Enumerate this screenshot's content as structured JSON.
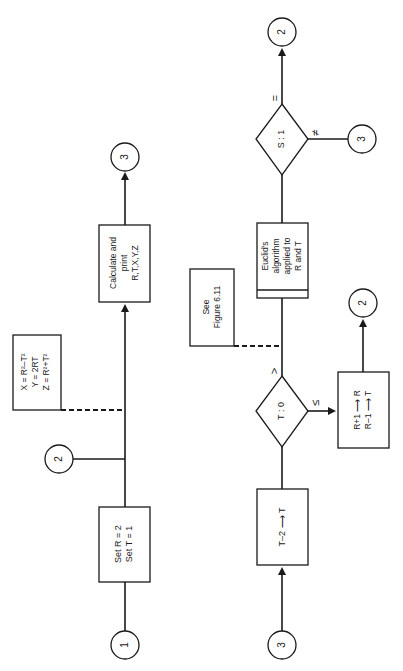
{
  "diagram": {
    "orientation": "rotated 90deg counter-clockwise",
    "colors": {
      "ink": "#1a1a1a",
      "background": "#ffffff"
    },
    "flow_top": {
      "start_connector": "1",
      "init_box": {
        "line1": "Set   R  =  2",
        "line2": "Set   T  =  1"
      },
      "entry_connector": "2",
      "formula_box": {
        "line1": "X  =  R²–T²",
        "line2": "Y  =  2RT",
        "line3": "Z  =  R²+T²"
      },
      "calc_box": {
        "line1": "Calculate and",
        "line2": "print",
        "line3": "R,T,X,Y,Z"
      },
      "exit_connector": "3"
    },
    "flow_bottom": {
      "start_connector": "3",
      "decrement_box": {
        "line1": "T–2 ⟶ T"
      },
      "decision_t": {
        "label": "T : 0",
        "branch_gt": ">",
        "branch_le": "≤"
      },
      "update_box": {
        "line1": "R+1 ⟶ R",
        "line2": "R–1 ⟶ T"
      },
      "update_exit_connector": "2",
      "note_box": {
        "line1": "See",
        "line2": "Figure 6.11"
      },
      "euclid_box": {
        "line1": "Euclid's",
        "line2": "algorithm",
        "line3": "applied to",
        "line4": "R  and  T"
      },
      "decision_s": {
        "label": "S : 1",
        "branch_eq": "=",
        "branch_ne": "≠"
      },
      "eq_connector": "2",
      "ne_connector": "3"
    }
  }
}
